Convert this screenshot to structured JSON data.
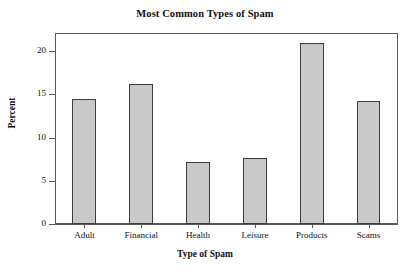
{
  "chart_data": {
    "type": "bar",
    "title": "Most Common Types of Spam",
    "xlabel": "Type of Spam",
    "ylabel": "Percent",
    "categories": [
      "Adult",
      "Financial",
      "Health",
      "Leisure",
      "Products",
      "Scams"
    ],
    "values": [
      14.5,
      16.2,
      7.2,
      7.7,
      21.0,
      14.2
    ],
    "ylim": [
      0,
      22
    ],
    "yticks": [
      0,
      5,
      10,
      15,
      20
    ],
    "ytick_labels": [
      "0",
      "5",
      "10",
      "15",
      "20"
    ],
    "grid": false,
    "legend": "none",
    "bar_fill_color": "#c9c9c9",
    "bar_border_color": "#3d3d3d",
    "frame_color": "#5a5a5a",
    "background_color": "#ffffff"
  }
}
